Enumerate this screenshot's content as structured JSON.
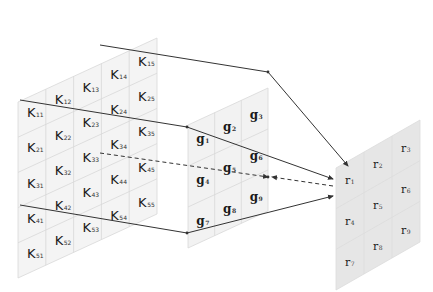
{
  "diagram": {
    "input_grid": {
      "name": "K",
      "rows": 5,
      "cols": 5,
      "cells": [
        [
          "K",
          "11"
        ],
        [
          "K",
          "12"
        ],
        [
          "K",
          "13"
        ],
        [
          "K",
          "14"
        ],
        [
          "K",
          "15"
        ],
        [
          "K",
          "21"
        ],
        [
          "K",
          "22"
        ],
        [
          "K",
          "23"
        ],
        [
          "K",
          "24"
        ],
        [
          "K",
          "25"
        ],
        [
          "K",
          "31"
        ],
        [
          "K",
          "32"
        ],
        [
          "K",
          "33"
        ],
        [
          "K",
          "34"
        ],
        [
          "K",
          "35"
        ],
        [
          "K",
          "41"
        ],
        [
          "K",
          "42"
        ],
        [
          "K",
          "43"
        ],
        [
          "K",
          "44"
        ],
        [
          "K",
          "45"
        ],
        [
          "K",
          "51"
        ],
        [
          "K",
          "52"
        ],
        [
          "K",
          "53"
        ],
        [
          "K",
          "54"
        ],
        [
          "K",
          "55"
        ]
      ],
      "fill": "#f4f4f4",
      "grid_color": "#d8d8d8"
    },
    "kernel_grid": {
      "name": "g",
      "rows": 3,
      "cols": 3,
      "cells": [
        [
          "g",
          "1"
        ],
        [
          "g",
          "2"
        ],
        [
          "g",
          "3"
        ],
        [
          "g",
          "4"
        ],
        [
          "g",
          "5"
        ],
        [
          "g",
          "6"
        ],
        [
          "g",
          "7"
        ],
        [
          "g",
          "8"
        ],
        [
          "g",
          "9"
        ]
      ],
      "fill": "#f2f2f2",
      "grid_color": "#d8d8d8"
    },
    "output_grid": {
      "name": "r",
      "rows": 3,
      "cols": 3,
      "cells": [
        [
          "r",
          "1"
        ],
        [
          "r",
          "2"
        ],
        [
          "r",
          "3"
        ],
        [
          "r",
          "4"
        ],
        [
          "r",
          "5"
        ],
        [
          "r",
          "6"
        ],
        [
          "r",
          "7"
        ],
        [
          "r",
          "8"
        ],
        [
          "r",
          "9"
        ]
      ],
      "fill": "#e6e6e6",
      "grid_color": "#dcdcdc"
    },
    "connectors": [
      {
        "style": "solid",
        "from": "K14",
        "via": "g3-corner",
        "to": "r1-top"
      },
      {
        "style": "solid",
        "from": "K11",
        "via": "g1-corner",
        "to": "r1-left"
      },
      {
        "style": "dashed",
        "from": "K33",
        "via": "g9",
        "to": "r1"
      },
      {
        "style": "solid",
        "from": "K41",
        "via": "g7-corner",
        "to": "r1-bottom"
      }
    ],
    "line_color": "#333333"
  }
}
